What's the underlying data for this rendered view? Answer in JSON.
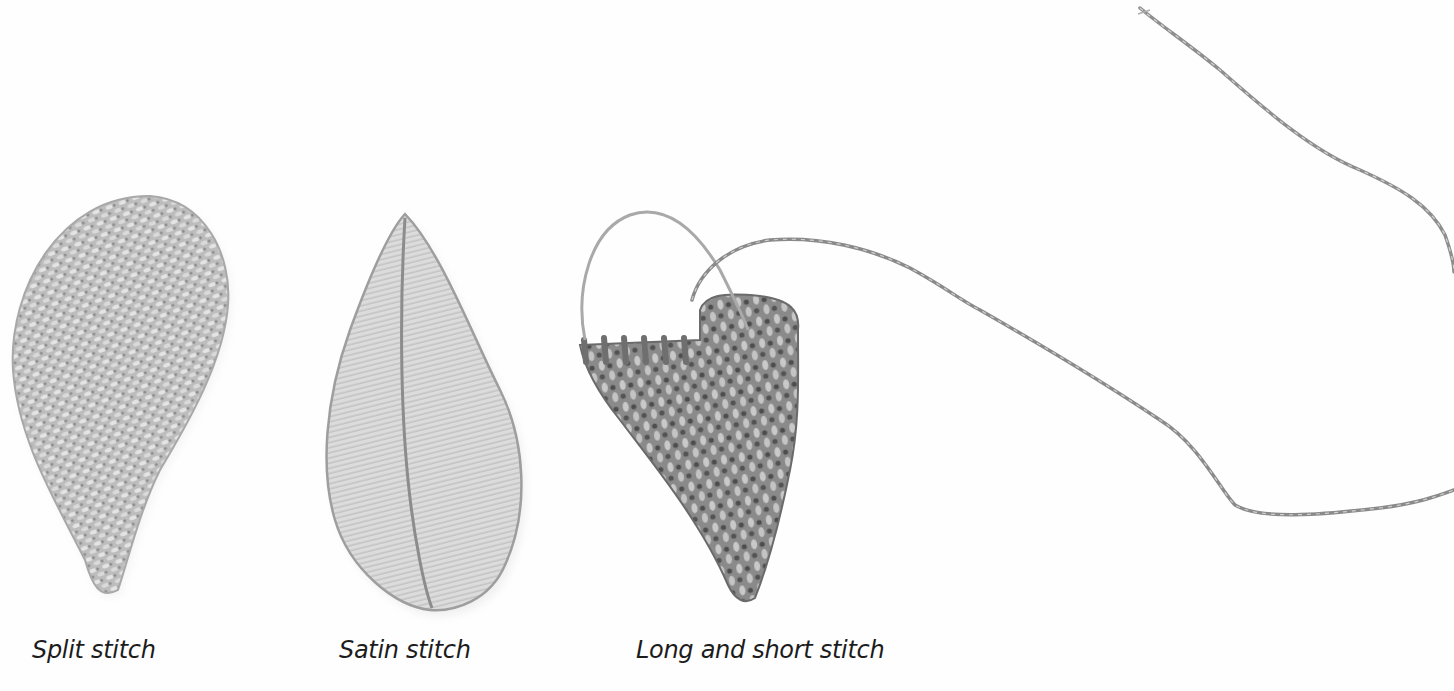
{
  "figure": {
    "background": "#fefefe",
    "samples": [
      {
        "id": "split",
        "caption": "Split stitch",
        "shape": "teardrop"
      },
      {
        "id": "satin",
        "caption": "Satin stitch",
        "shape": "leaf"
      },
      {
        "id": "long-short",
        "caption": "Long and short stitch",
        "shape": "heart (partially stitched)"
      }
    ],
    "thread": {
      "description": "loose embroidery thread",
      "color": "#8a8a8a"
    }
  }
}
